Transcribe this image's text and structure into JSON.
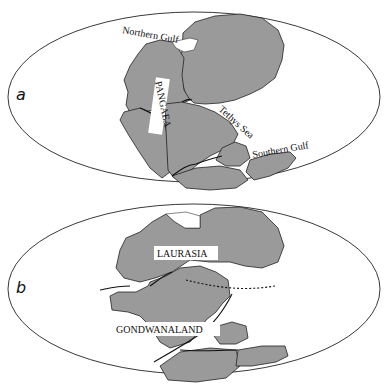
{
  "figure": {
    "colors": {
      "land": "#9a9a9a",
      "ocean": "#ffffff",
      "outline": "#222222"
    },
    "panels": [
      {
        "id": "a",
        "letter": "a",
        "labels": {
          "supercontinent": "PANGAEA",
          "northern_gulf": "Northern Gulf",
          "tethys": "Tethys Sea",
          "southern_gulf": "Southern Gulf"
        }
      },
      {
        "id": "b",
        "letter": "b",
        "labels": {
          "north": "LAURASIA",
          "south": "GONDWANALAND"
        }
      }
    ]
  }
}
